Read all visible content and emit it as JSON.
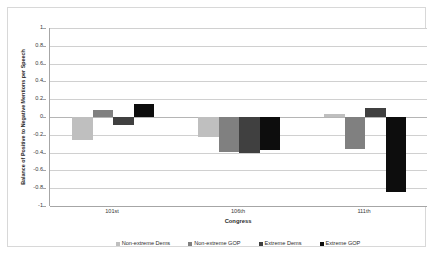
{
  "chart_data": {
    "type": "bar",
    "title": "",
    "xlabel": "Congress",
    "ylabel": "Balance of Positive to Negative Mentions per Speech",
    "categories": [
      "101st",
      "106th",
      "111th"
    ],
    "ylim": [
      -1,
      1
    ],
    "ytick_labels": [
      "1",
      "0.8",
      "0.6",
      "0.4",
      "0.2",
      "0",
      "-0.2",
      "-0.4",
      "-0.6",
      "-0.8",
      "-1"
    ],
    "ytick_values": [
      1,
      0.8,
      0.6,
      0.4,
      0.2,
      0,
      -0.2,
      -0.4,
      -0.6,
      -0.8,
      -1
    ],
    "grid": true,
    "legend_position": "bottom",
    "series": [
      {
        "name": "Non-extreme Dems",
        "color": "#bfbfbf",
        "values": [
          -0.26,
          -0.23,
          0.03
        ]
      },
      {
        "name": "Non-extreme GOP",
        "color": "#808080",
        "values": [
          0.08,
          -0.39,
          -0.36
        ]
      },
      {
        "name": "Extreme Dems",
        "color": "#404040",
        "values": [
          -0.09,
          -0.4,
          0.1
        ]
      },
      {
        "name": "Extreme GOP",
        "color": "#0d0d0d",
        "values": [
          0.15,
          -0.37,
          -0.84
        ]
      }
    ]
  }
}
